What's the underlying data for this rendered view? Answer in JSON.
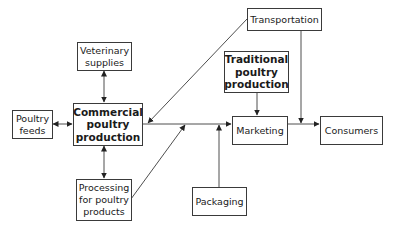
{
  "diagram": {
    "type": "flowchart",
    "title": "",
    "nodes": [
      {
        "id": "veterinary",
        "label": "Veterinary\nsupplies",
        "bold": false
      },
      {
        "id": "transportation",
        "label": "Transportation",
        "bold": false
      },
      {
        "id": "traditional",
        "label": "Traditional\npoultry\nproduction",
        "bold": true
      },
      {
        "id": "feeds",
        "label": "Poultry\nfeeds",
        "bold": false
      },
      {
        "id": "commercial",
        "label": "Commercial\npoultry\nproduction",
        "bold": true
      },
      {
        "id": "marketing",
        "label": "Marketing",
        "bold": false
      },
      {
        "id": "consumers",
        "label": "Consumers",
        "bold": false
      },
      {
        "id": "processing",
        "label": "Processing\nfor poultry\nproducts",
        "bold": false
      },
      {
        "id": "packaging",
        "label": "Packaging",
        "bold": false
      }
    ],
    "edges": [
      {
        "from": "veterinary",
        "to": "commercial",
        "direction": "both"
      },
      {
        "from": "feeds",
        "to": "commercial",
        "direction": "both"
      },
      {
        "from": "commercial",
        "to": "processing",
        "direction": "both"
      },
      {
        "from": "commercial",
        "to": "marketing",
        "direction": "forward"
      },
      {
        "from": "transportation",
        "to": "commercial",
        "direction": "forward"
      },
      {
        "from": "processing",
        "to": "marketing",
        "direction": "forward"
      },
      {
        "from": "packaging",
        "to": "marketing",
        "direction": "forward"
      },
      {
        "from": "traditional",
        "to": "marketing",
        "direction": "forward"
      },
      {
        "from": "transportation",
        "to": "consumers",
        "direction": "forward",
        "note": "joins marketing-consumers link"
      },
      {
        "from": "marketing",
        "to": "consumers",
        "direction": "forward"
      }
    ]
  },
  "colors": {
    "line": "#3a3a3a",
    "border": "#3a3a3a",
    "background": "#ffffff",
    "text": "#1a1a1a"
  }
}
